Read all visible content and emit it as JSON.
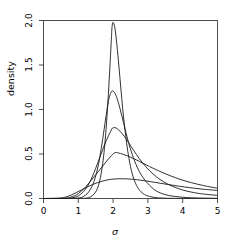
{
  "chart_data": {
    "type": "line",
    "title": "",
    "subtitle": "",
    "xlabel": "σ",
    "ylabel": "density",
    "xlim": [
      0,
      5
    ],
    "ylim": [
      0,
      2.0
    ],
    "grid": false,
    "legend": "none",
    "xticks": [
      "0",
      "1",
      "2",
      "3",
      "4",
      "5"
    ],
    "xtick_values": [
      0,
      1,
      2,
      3,
      4,
      5
    ],
    "yticks": [
      "0.0",
      "0.5",
      "1.0",
      "1.5",
      "2.0"
    ],
    "ytick_values": [
      0.0,
      0.5,
      1.0,
      1.5,
      2.0
    ],
    "line_color": "#1a1a1a",
    "line_width": 0.9,
    "series": [
      {
        "name": "curve-1",
        "peak_x": 1.97,
        "peak_y": 1.98,
        "x": [
          0.0,
          0.7,
          0.9,
          1.1,
          1.2,
          1.3,
          1.4,
          1.5,
          1.55,
          1.6,
          1.65,
          1.7,
          1.75,
          1.8,
          1.85,
          1.9,
          1.95,
          1.97,
          2.0,
          2.05,
          2.1,
          2.15,
          2.2,
          2.25,
          2.3,
          2.4,
          2.5,
          2.6,
          2.7,
          2.8,
          2.9,
          3.0,
          3.2,
          3.4,
          3.6,
          3.8,
          4.0,
          4.25,
          4.5,
          4.75,
          5.0
        ],
        "y": [
          0.0,
          0.0,
          0.0,
          0.001,
          0.003,
          0.01,
          0.03,
          0.075,
          0.115,
          0.175,
          0.265,
          0.39,
          0.56,
          0.79,
          1.08,
          1.42,
          1.79,
          1.93,
          1.98,
          1.92,
          1.76,
          1.56,
          1.34,
          1.12,
          0.915,
          0.59,
          0.36,
          0.215,
          0.128,
          0.076,
          0.046,
          0.028,
          0.011,
          0.005,
          0.002,
          0.001,
          0.001,
          0.0,
          0.0,
          0.0,
          0.0
        ]
      },
      {
        "name": "curve-2",
        "peak_x": 1.98,
        "peak_y": 1.21,
        "x": [
          0.0,
          0.7,
          0.9,
          1.05,
          1.15,
          1.25,
          1.35,
          1.45,
          1.55,
          1.62,
          1.7,
          1.78,
          1.85,
          1.9,
          1.95,
          1.98,
          2.02,
          2.08,
          2.15,
          2.25,
          2.35,
          2.45,
          2.55,
          2.7,
          2.85,
          3.0,
          3.2,
          3.4,
          3.6,
          3.8,
          4.0,
          4.25,
          4.5,
          4.75,
          5.0
        ],
        "y": [
          0.0,
          0.0,
          0.002,
          0.008,
          0.022,
          0.052,
          0.105,
          0.19,
          0.33,
          0.47,
          0.665,
          0.88,
          1.06,
          1.15,
          1.2,
          1.21,
          1.2,
          1.16,
          1.08,
          0.93,
          0.77,
          0.62,
          0.495,
          0.345,
          0.24,
          0.168,
          0.095,
          0.056,
          0.034,
          0.022,
          0.014,
          0.008,
          0.005,
          0.003,
          0.002
        ]
      },
      {
        "name": "curve-3",
        "peak_x": 2.0,
        "peak_y": 0.8,
        "x": [
          0.0,
          0.6,
          0.8,
          0.95,
          1.05,
          1.15,
          1.25,
          1.35,
          1.45,
          1.55,
          1.65,
          1.75,
          1.85,
          1.95,
          2.0,
          2.1,
          2.2,
          2.32,
          2.45,
          2.6,
          2.75,
          2.9,
          3.05,
          3.25,
          3.45,
          3.7,
          4.0,
          4.3,
          4.6,
          5.0
        ],
        "y": [
          0.0,
          0.001,
          0.006,
          0.02,
          0.042,
          0.078,
          0.13,
          0.2,
          0.29,
          0.39,
          0.495,
          0.6,
          0.69,
          0.77,
          0.795,
          0.79,
          0.755,
          0.7,
          0.625,
          0.535,
          0.45,
          0.375,
          0.312,
          0.242,
          0.188,
          0.138,
          0.095,
          0.068,
          0.05,
          0.035
        ]
      },
      {
        "name": "curve-4",
        "peak_x": 2.05,
        "peak_y": 0.515,
        "x": [
          0.0,
          0.55,
          0.75,
          0.9,
          1.0,
          1.1,
          1.2,
          1.32,
          1.45,
          1.58,
          1.7,
          1.82,
          1.95,
          2.05,
          2.15,
          2.28,
          2.42,
          2.58,
          2.75,
          2.95,
          3.15,
          3.4,
          3.65,
          3.95,
          4.25,
          4.6,
          5.0
        ],
        "y": [
          0.0,
          0.002,
          0.012,
          0.032,
          0.055,
          0.086,
          0.125,
          0.18,
          0.243,
          0.305,
          0.363,
          0.423,
          0.48,
          0.515,
          0.512,
          0.498,
          0.478,
          0.45,
          0.418,
          0.378,
          0.34,
          0.295,
          0.255,
          0.212,
          0.178,
          0.145,
          0.115
        ]
      },
      {
        "name": "curve-5",
        "peak_x": 2.2,
        "peak_y": 0.222,
        "x": [
          0.0,
          0.45,
          0.65,
          0.8,
          0.95,
          1.1,
          1.25,
          1.4,
          1.55,
          1.7,
          1.85,
          2.0,
          2.2,
          2.4,
          2.55,
          2.7,
          2.9,
          3.1,
          3.35,
          3.6,
          3.9,
          4.2,
          4.55,
          4.8,
          5.0
        ],
        "y": [
          0.0,
          0.004,
          0.018,
          0.04,
          0.068,
          0.098,
          0.128,
          0.155,
          0.178,
          0.196,
          0.21,
          0.218,
          0.222,
          0.22,
          0.216,
          0.21,
          0.2,
          0.188,
          0.172,
          0.156,
          0.138,
          0.122,
          0.106,
          0.097,
          0.09
        ]
      }
    ]
  },
  "axes": {
    "x_axis_name": "sigma-axis",
    "y_axis_name": "density-axis"
  }
}
